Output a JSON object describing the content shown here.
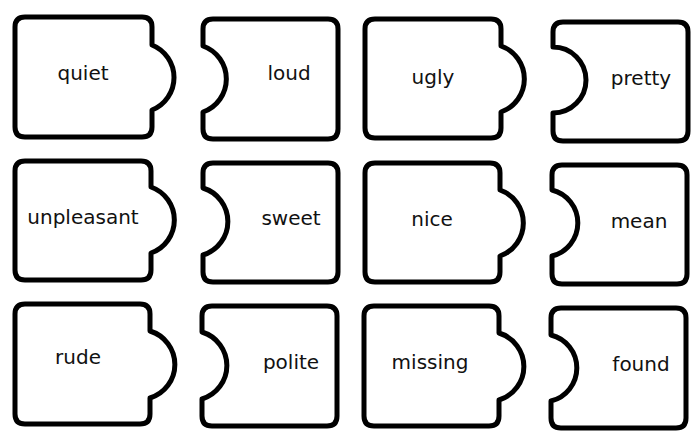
{
  "worksheet": {
    "header_fragment": "",
    "pairs": [
      {
        "left": "quiet",
        "right": "loud"
      },
      {
        "left": "ugly",
        "right": "pretty"
      },
      {
        "left": "unpleasant",
        "right": "sweet"
      },
      {
        "left": "nice",
        "right": "mean"
      },
      {
        "left": "rude",
        "right": "polite"
      },
      {
        "left": "missing",
        "right": "found"
      }
    ]
  },
  "colors": {
    "outline": "#000000",
    "background": "#ffffff",
    "text": "#111111"
  }
}
